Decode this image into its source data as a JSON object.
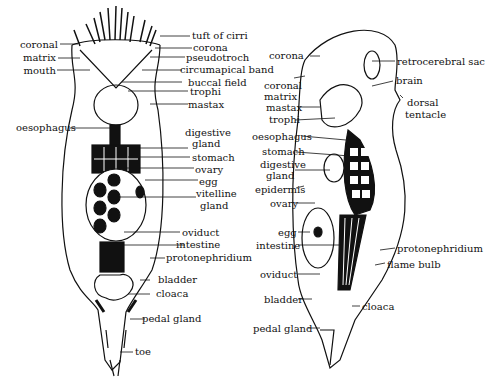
{
  "figure": {
    "left_view": {
      "labels": {
        "tuft_of_cirri": "tuft of cirri",
        "corona": "corona",
        "pseudotroch": "pseudotroch",
        "circumapical_band": "circumapical band",
        "buccal_field": "buccal field",
        "trophi": "trophi",
        "mastax": "mastax",
        "coronal": "coronal",
        "matrix": "matrix",
        "mouth": "mouth",
        "oesophagus": "oesophagus",
        "digestive": "digestive",
        "gland": "gland",
        "stomach": "stomach",
        "ovary": "ovary",
        "egg": "egg",
        "vitelline": "vitelline",
        "vitelline_gland": "gland",
        "oviduct": "oviduct",
        "intestine": "intestine",
        "protonephridium": "protonephridium",
        "bladder": "bladder",
        "cloaca": "cloaca",
        "pedal_gland": "pedal gland",
        "toe": "toe"
      }
    },
    "right_view": {
      "labels": {
        "corona": "corona",
        "retrocerebral_sac": "retrocerebral sac",
        "brain": "brain",
        "dorsal": "dorsal",
        "tentacle": "tentacle",
        "coronal": "coronal",
        "matrix": "matrix",
        "mastax": "mastax",
        "trophi": "trophi",
        "oesophagus": "oesophagus",
        "stomach": "stomach",
        "digestive": "digestive",
        "gland": "gland",
        "epidermis": "epidermis",
        "ovary": "ovary",
        "egg": "egg",
        "intestine": "intestine",
        "protonephridium": "protonephridium",
        "flame_bulb": "flame bulb",
        "oviduct": "oviduct",
        "bladder": "bladder",
        "cloaca": "cloaca",
        "pedal_gland": "pedal gland"
      }
    }
  }
}
